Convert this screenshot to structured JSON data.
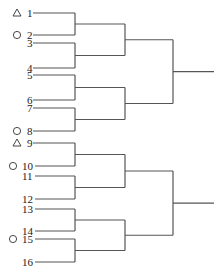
{
  "diagram": {
    "type": "tournament-bracket",
    "stroke_color": "#555555",
    "entries": [
      {
        "label": "1",
        "marker": "triangle",
        "y": 13
      },
      {
        "label": "2",
        "marker": "circle",
        "y": 35
      },
      {
        "label": "3",
        "marker": "",
        "y": 43
      },
      {
        "label": "4",
        "marker": "",
        "y": 68
      },
      {
        "label": "5",
        "marker": "",
        "y": 75
      },
      {
        "label": "6",
        "marker": "",
        "y": 100
      },
      {
        "label": "7",
        "marker": "",
        "y": 108
      },
      {
        "label": "8",
        "marker": "circle",
        "y": 131
      },
      {
        "label": "9",
        "marker": "triangle",
        "y": 143
      },
      {
        "label": "10",
        "marker": "circle",
        "y": 166
      },
      {
        "label": "11",
        "marker": "",
        "y": 176
      },
      {
        "label": "12",
        "marker": "",
        "y": 199
      },
      {
        "label": "13",
        "marker": "",
        "y": 209
      },
      {
        "label": "14",
        "marker": "",
        "y": 231
      },
      {
        "label": "15",
        "marker": "circle",
        "y": 239
      },
      {
        "label": "16",
        "marker": "",
        "y": 262
      }
    ],
    "legend_markers": {
      "triangle": "triangle-icon",
      "circle": "circle-icon"
    },
    "rounds": {
      "round1_x": 75,
      "round2_x": 125,
      "round3_x": 173,
      "final_x": 214
    }
  }
}
